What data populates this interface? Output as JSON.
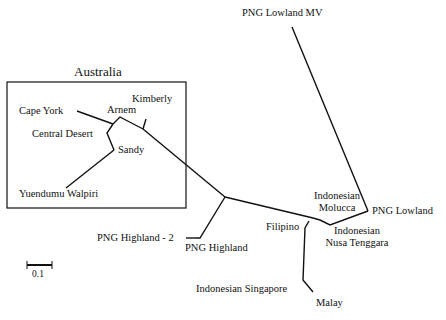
{
  "diagram": {
    "type": "unrooted phylogenetic tree",
    "group_box": {
      "title": "Australia"
    },
    "scale_bar": {
      "label": "0.1"
    },
    "taxa": {
      "png_lowland_mv": "PNG Lowland MV",
      "kimberly": "Kimberly",
      "cape_york": "Cape York",
      "arnem": "Arnem",
      "central_desert": "Central Desert",
      "sandy": "Sandy",
      "yuendumu_walpiri": "Yuendumu Walpiri",
      "indonesian_molucca_1": "Indonesian",
      "indonesian_molucca_2": "Molucca",
      "png_lowland": "PNG Lowland",
      "filipino": "Filipino",
      "indonesian_nusa_1": "Indonesian",
      "indonesian_nusa_2": "Nusa Tenggara",
      "png_highland_2": "PNG Highland - 2",
      "png_highland": "PNG Highland",
      "indonesian_singapore": "Indonesian Singapore",
      "malay": "Malay"
    },
    "colors": {
      "line": "#111111",
      "background": "#ffffff"
    }
  }
}
